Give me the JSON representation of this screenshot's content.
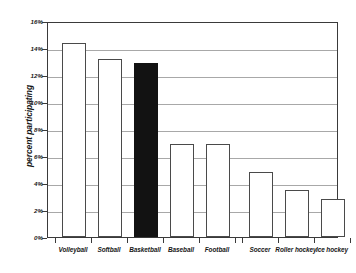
{
  "chart_data": {
    "type": "bar",
    "title": "",
    "xlabel": "",
    "ylabel": "percent participating",
    "ylim": [
      0,
      16
    ],
    "ytick_labels": [
      "0%",
      "2%",
      "4%",
      "6%",
      "8%",
      "10%",
      "12%",
      "14%",
      "16%"
    ],
    "ytick_values": [
      0,
      2,
      4,
      6,
      8,
      10,
      12,
      14,
      16
    ],
    "grid": true,
    "legend": "none",
    "categories": [
      "Volleyball",
      "Softball",
      "Basketball",
      "Baseball",
      "Football",
      "Soccer",
      "Roller hockey",
      "Ice hockey"
    ],
    "values": [
      14.4,
      13.2,
      12.9,
      6.9,
      6.9,
      4.8,
      3.5,
      2.8
    ],
    "value_unit": "percent",
    "highlighted_category": "Basketball",
    "bar_colors": [
      "#ffffff",
      "#ffffff",
      "#121212",
      "#ffffff",
      "#ffffff",
      "#ffffff",
      "#ffffff",
      "#ffffff"
    ],
    "bar_edge_color": "#4a4a4a",
    "gridline_color": "#a8a8a8",
    "frame_color": "#3a3a3a",
    "background_color": "#ffffff"
  }
}
